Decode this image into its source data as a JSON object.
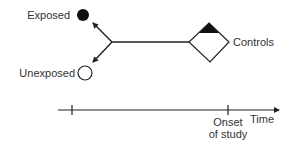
{
  "diagram": {
    "labels": {
      "exposed": "Exposed",
      "unexposed": "Unexposed",
      "controls": "Controls",
      "time": "Time",
      "onset_line1": "Onset",
      "onset_line2": "of study"
    },
    "colors": {
      "ink": "#222222",
      "text": "#333333",
      "background": "#ffffff"
    },
    "nodes": [
      {
        "id": "exposed",
        "shape": "filled-circle"
      },
      {
        "id": "unexposed",
        "shape": "open-circle"
      },
      {
        "id": "controls",
        "shape": "diamond-with-filled-top"
      }
    ],
    "timeline": {
      "ticks": [
        "start",
        "onset-of-study"
      ]
    }
  }
}
